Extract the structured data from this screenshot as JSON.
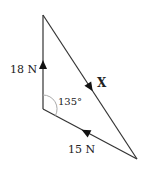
{
  "diagram": {
    "type": "vector-triangle",
    "colors": {
      "line": "#333333",
      "arc": "#aaaaaa",
      "text": "#222222",
      "background": "#ffffff"
    },
    "vertices": {
      "top": [
        43,
        15
      ],
      "bottom_left": [
        43,
        109
      ],
      "right": [
        137,
        159
      ]
    },
    "vectors": [
      {
        "label": "18 N",
        "from": "bottom_left",
        "to": "top",
        "direction": "up"
      },
      {
        "label": "X",
        "from": "top",
        "to": "right",
        "direction": "down-right"
      },
      {
        "label": "15 N",
        "from": "right",
        "to": "bottom_left",
        "direction": "up-left"
      }
    ],
    "angle": {
      "label": "135°",
      "at": "bottom_left"
    },
    "labels": {
      "force_18": "18 N",
      "force_x": "X",
      "force_15": "15 N",
      "angle": "135°"
    }
  }
}
